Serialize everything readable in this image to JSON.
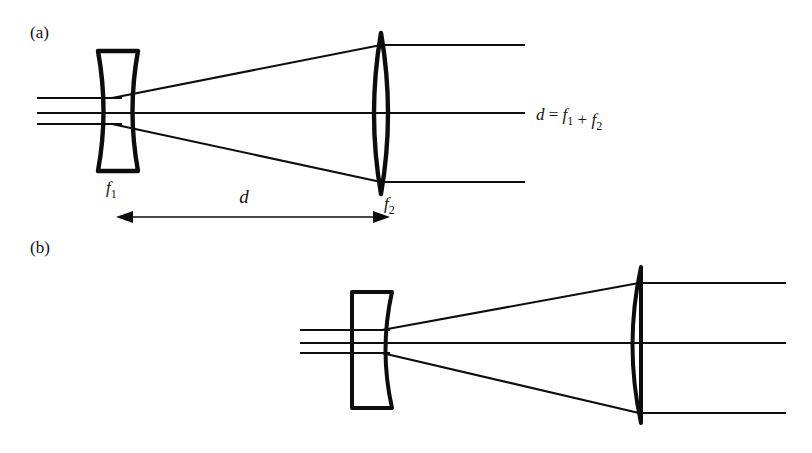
{
  "figure": {
    "background_color": "#ffffff",
    "ink_color": "#0d0d0d",
    "width": 812,
    "height": 453
  },
  "panels": [
    {
      "id": "a",
      "label": "(a)",
      "label_x": 30,
      "label_y": 38,
      "description": "Biconcave lens f1 followed by biconvex lens f2, separated by distance d",
      "lenses": [
        {
          "name": "lens-f1",
          "kind": "biconcave",
          "label": "f",
          "subscript": "1",
          "label_x": 106,
          "label_y": 193,
          "center_x": 118,
          "top_y": 51,
          "bottom_y": 171,
          "half_width": 20,
          "waist_half_width": 9
        },
        {
          "name": "lens-f2",
          "kind": "biconvex",
          "label": "f",
          "subscript": "2",
          "label_x": 384,
          "label_y": 209,
          "center_x": 381,
          "top_y": 33,
          "bottom_y": 194,
          "bulge": 14
        }
      ],
      "rays": {
        "incoming_y": [
          98,
          113,
          124
        ],
        "incoming_x_start": 37,
        "outgoing_y": [
          45,
          113,
          182
        ],
        "outgoing_x_end": 525,
        "axis_y": 113
      },
      "dimension": {
        "name": "distance-d",
        "label": "d",
        "label_x": 244,
        "label_y": 203,
        "line_y": 217,
        "x_start": 116,
        "x_end": 390
      },
      "annotation": {
        "name": "equation-d",
        "text": "d = f1 + f2",
        "parts": [
          "d",
          " = ",
          "f",
          "1",
          " + ",
          "f",
          "2"
        ],
        "x": 536,
        "y": 120
      }
    },
    {
      "id": "b",
      "label": "(b)",
      "label_x": 30,
      "label_y": 253,
      "description": "Plano-concave lens followed by plano-convex lens, beam expanding",
      "lenses": [
        {
          "name": "lens-plano-concave",
          "kind": "plano-concave",
          "center_x": 371,
          "left_x": 352,
          "right_x": 392,
          "top_y": 292,
          "bottom_y": 408,
          "concave_depth": 13
        },
        {
          "name": "lens-plano-convex",
          "kind": "plano-convex",
          "flat_x": 641,
          "top_y": 267,
          "bottom_y": 423,
          "bulge": 17
        }
      ],
      "rays": {
        "incoming_y": [
          330,
          343,
          353
        ],
        "incoming_x_start": 300,
        "outgoing_y": [
          283,
          343,
          413
        ],
        "outgoing_x_end": 786,
        "axis_y": 343
      }
    }
  ]
}
